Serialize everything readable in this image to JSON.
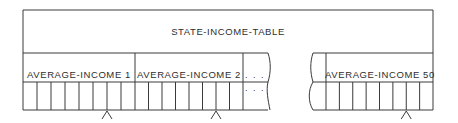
{
  "diagram": {
    "title": "STATE-INCOME-TABLE",
    "groups": [
      {
        "label": "AVERAGE-INCOME 1",
        "cells": 8,
        "marker_after_cell": 6
      },
      {
        "label": "AVERAGE-INCOME 2",
        "cells": 8,
        "marker_after_cell": 6
      },
      {
        "label": "AVERAGE-INCOME 50",
        "cells": 8,
        "marker_after_cell": 6
      }
    ],
    "ellipsis": {
      "label_row": ". . .",
      "cell_row": ". . ."
    },
    "colors": {
      "line": "#3a3a3a",
      "text": "#2e2e2e",
      "background": "#ffffff"
    }
  }
}
